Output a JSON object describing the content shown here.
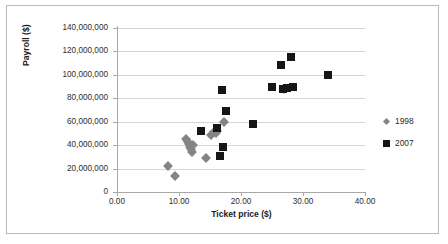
{
  "chart_data": {
    "type": "scatter",
    "title": "",
    "xlabel": "Ticket price ($)",
    "ylabel": "Payroll ($)",
    "xlim": [
      0,
      40
    ],
    "ylim": [
      0,
      140000000
    ],
    "xticks": [
      "0.00",
      "10.00",
      "20.00",
      "30.00",
      "40.00"
    ],
    "xtick_values": [
      0,
      10,
      20,
      30,
      40
    ],
    "yticks": [
      "0",
      "20,000,000",
      "40,000,000",
      "60,000,000",
      "80,000,000",
      "100,000,000",
      "120,000,000",
      "140,000,000"
    ],
    "ytick_values": [
      0,
      20000000,
      40000000,
      60000000,
      80000000,
      100000000,
      120000000,
      140000000
    ],
    "grid": true,
    "legend_position": "right",
    "series": [
      {
        "name": "1998",
        "marker": "diamond",
        "color": "#848484",
        "points": [
          [
            8.3,
            22000000
          ],
          [
            9.3,
            13500000
          ],
          [
            11.1,
            45000000
          ],
          [
            11.4,
            43000000
          ],
          [
            11.6,
            41000000
          ],
          [
            11.7,
            38000000
          ],
          [
            11.9,
            36500000
          ],
          [
            12.1,
            34500000
          ],
          [
            12.3,
            40000000
          ],
          [
            14.3,
            29000000
          ],
          [
            15.1,
            48500000
          ],
          [
            15.6,
            51000000
          ],
          [
            15.9,
            50000000
          ],
          [
            16.1,
            52500000
          ],
          [
            17.2,
            59500000
          ],
          [
            26.9,
            88000000
          ]
        ]
      },
      {
        "name": "2007",
        "marker": "square",
        "color": "#161616",
        "points": [
          [
            13.6,
            52000000
          ],
          [
            16.2,
            54500000
          ],
          [
            16.6,
            30500000
          ],
          [
            17.0,
            87000000
          ],
          [
            17.1,
            38500000
          ],
          [
            17.5,
            69000000
          ],
          [
            22.0,
            58000000
          ],
          [
            25.0,
            90000000
          ],
          [
            26.4,
            108500000
          ],
          [
            26.7,
            88000000
          ],
          [
            27.4,
            89000000
          ],
          [
            28.0,
            115500000
          ],
          [
            28.4,
            90000000
          ],
          [
            34.0,
            99500000
          ]
        ]
      }
    ]
  },
  "legend": {
    "items": [
      {
        "label": "1998",
        "marker": "diamond"
      },
      {
        "label": "2007",
        "marker": "square"
      }
    ]
  }
}
